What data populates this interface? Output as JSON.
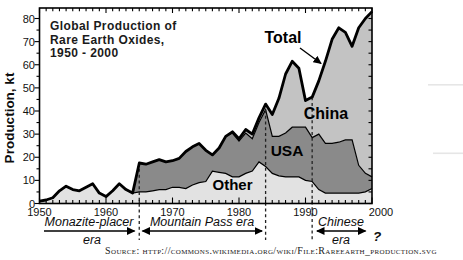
{
  "figure": {
    "title_lines": [
      "Global Production of",
      "Rare Earth Oxides,",
      "1950 - 2000"
    ],
    "y_axis_label": "Production, kt",
    "source": "Source: http://commons.wikimedia.org/wiki/File:Rareearth_production.svg"
  },
  "series_labels": {
    "total": "Total",
    "china": "China",
    "usa": "USA",
    "other": "Other"
  },
  "eras": {
    "monazite": {
      "line1": "Monazite-placer",
      "line2": "era"
    },
    "mountain": {
      "line1": "Mountain Pass era"
    },
    "chinese": {
      "line1": "Chinese",
      "line2": "era"
    },
    "question_mark": "?"
  },
  "axes": {
    "x_ticks": [
      1950,
      1960,
      1970,
      1980,
      1990,
      2000
    ],
    "y_ticks": [
      0,
      10,
      20,
      30,
      40,
      50,
      60,
      70,
      80
    ],
    "x_minor_step": 1,
    "y_minor_step": 5
  },
  "colors": {
    "other": "#e2e2e2",
    "usa": "#8a8a8a",
    "china": "#c3c3c3",
    "line": "#000000"
  },
  "chart_data": {
    "type": "area",
    "stacked": true,
    "title": "Global Production of Rare Earth Oxides, 1950 - 2000",
    "xlabel": "",
    "ylabel": "Production, kt",
    "xlim": [
      1950,
      2000
    ],
    "ylim": [
      0,
      84
    ],
    "legend_position": "inline-labels",
    "grid": false,
    "x": [
      1950,
      1951,
      1952,
      1953,
      1954,
      1955,
      1956,
      1957,
      1958,
      1959,
      1960,
      1961,
      1962,
      1963,
      1964,
      1965,
      1966,
      1967,
      1968,
      1969,
      1970,
      1971,
      1972,
      1973,
      1974,
      1975,
      1976,
      1977,
      1978,
      1979,
      1980,
      1981,
      1982,
      1983,
      1984,
      1985,
      1986,
      1987,
      1988,
      1989,
      1990,
      1991,
      1992,
      1993,
      1994,
      1995,
      1996,
      1997,
      1998,
      1999,
      2000
    ],
    "series": [
      {
        "name": "Other",
        "values": [
          1,
          1.5,
          2.5,
          5.5,
          7.5,
          6,
          5.5,
          7,
          8.5,
          4.5,
          3,
          5.5,
          8.5,
          6,
          4.5,
          5,
          5,
          5.5,
          6,
          6,
          7,
          7,
          6.5,
          8,
          9,
          9.5,
          14,
          13.5,
          13,
          11.5,
          11.5,
          13,
          14,
          18,
          16,
          13,
          12,
          11.5,
          11.5,
          11.5,
          10,
          9.5,
          6,
          4.5,
          4.5,
          4.5,
          4.5,
          4.5,
          4.5,
          5,
          6.5
        ]
      },
      {
        "name": "USA",
        "values": [
          0,
          0,
          0,
          0,
          0,
          0,
          0,
          0,
          0,
          0,
          0,
          0,
          0,
          0,
          0,
          12.5,
          12,
          12.5,
          13,
          12,
          11.5,
          12.5,
          16,
          16.5,
          17,
          13.5,
          7,
          10.5,
          16,
          19,
          15.5,
          17.5,
          14,
          17,
          24.5,
          16,
          17,
          19,
          21.5,
          21.5,
          23,
          19,
          24,
          21.5,
          21.5,
          22,
          23,
          23,
          12,
          8,
          5
        ]
      },
      {
        "name": "China",
        "values": [
          0,
          0,
          0,
          0,
          0,
          0,
          0,
          0,
          0,
          0,
          0,
          0,
          0,
          0,
          0,
          0,
          0,
          0,
          0,
          0,
          0,
          0,
          0,
          0,
          0,
          0,
          0,
          0,
          0,
          0.5,
          1,
          1.5,
          2,
          2,
          2.5,
          9.5,
          16.5,
          25.5,
          28.5,
          25.5,
          11.5,
          17.5,
          23,
          35.5,
          45,
          49.5,
          46.5,
          40.5,
          59.5,
          67,
          71.5
        ]
      }
    ],
    "total": [
      1,
      1.5,
      2.5,
      5.5,
      7.5,
      6,
      5.5,
      7,
      8.5,
      4.5,
      3,
      5.5,
      8.5,
      6,
      4.5,
      17.5,
      17,
      18,
      19,
      18,
      18.5,
      19.5,
      22.5,
      24.5,
      26,
      23,
      21,
      24,
      29,
      31,
      28,
      32,
      30,
      37,
      43,
      38.5,
      45.5,
      56,
      61.5,
      58.5,
      44.5,
      46,
      53,
      61.5,
      71,
      76,
      74,
      68,
      76,
      80,
      83
    ],
    "dashed_lines_x": [
      1965,
      1984,
      1991
    ],
    "era_annotations": [
      {
        "label": "Monazite-placer era",
        "start": 1950,
        "end": 1965
      },
      {
        "label": "Mountain Pass era",
        "start": 1965,
        "end": 1984
      },
      {
        "label": "Chinese era",
        "start": 1991,
        "end": 2000,
        "open_ended": true
      }
    ]
  }
}
